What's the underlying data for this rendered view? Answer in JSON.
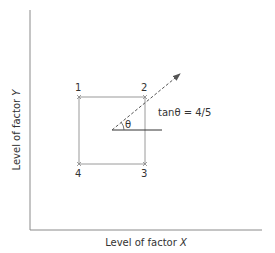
{
  "diagram": {
    "x_axis_label": "Level of factor ",
    "x_axis_var": "X",
    "y_axis_label": "Level of factor ",
    "y_axis_var": "Y",
    "corners": [
      {
        "label": "1"
      },
      {
        "label": "2"
      },
      {
        "label": "3"
      },
      {
        "label": "4"
      }
    ],
    "angle_symbol": "θ",
    "equation": "tanθ = 4/5",
    "colors": {
      "axis": "#8a8a8a",
      "square": "#9a9a9a",
      "arrow": "#555555",
      "text": "#333333"
    }
  }
}
